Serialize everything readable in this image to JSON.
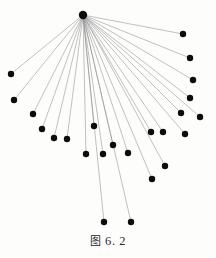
{
  "figure": {
    "caption_cjk": "图",
    "caption_number": "6. 2",
    "caption_full": "图 6. 2",
    "diagram_type": "star-graph",
    "background_color": "#fdfdfc",
    "node_color": "#0d0d0d",
    "edge_color": "#8e8e8e",
    "node_radius": 3.2,
    "hub_radius": 4.2,
    "edge_width": 0.55,
    "hub": {
      "id": "hub",
      "label": "hub",
      "x": 83,
      "y": 15
    },
    "leaf_nodes": [
      {
        "id": "n1",
        "x": 183,
        "y": 34
      },
      {
        "id": "n2",
        "x": 190,
        "y": 58
      },
      {
        "id": "n3",
        "x": 193,
        "y": 80
      },
      {
        "id": "n4",
        "x": 190,
        "y": 98
      },
      {
        "id": "n5",
        "x": 200,
        "y": 117
      },
      {
        "id": "n6",
        "x": 181,
        "y": 113
      },
      {
        "id": "n7",
        "x": 185,
        "y": 134
      },
      {
        "id": "n8",
        "x": 163,
        "y": 132
      },
      {
        "id": "n9",
        "x": 151,
        "y": 132
      },
      {
        "id": "n10",
        "x": 165,
        "y": 166
      },
      {
        "id": "n11",
        "x": 152,
        "y": 179
      },
      {
        "id": "n12",
        "x": 128,
        "y": 153
      },
      {
        "id": "n13",
        "x": 131,
        "y": 222
      },
      {
        "id": "n14",
        "x": 113,
        "y": 145
      },
      {
        "id": "n15",
        "x": 104,
        "y": 222
      },
      {
        "id": "n16",
        "x": 103,
        "y": 154
      },
      {
        "id": "n17",
        "x": 94,
        "y": 126
      },
      {
        "id": "n18",
        "x": 86,
        "y": 154
      },
      {
        "id": "n19",
        "x": 67,
        "y": 139
      },
      {
        "id": "n20",
        "x": 54,
        "y": 138
      },
      {
        "id": "n21",
        "x": 42,
        "y": 129
      },
      {
        "id": "n22",
        "x": 33,
        "y": 114
      },
      {
        "id": "n23",
        "x": 14,
        "y": 100
      },
      {
        "id": "n24",
        "x": 11,
        "y": 74
      }
    ],
    "node_count": 25,
    "edge_count": 24
  }
}
